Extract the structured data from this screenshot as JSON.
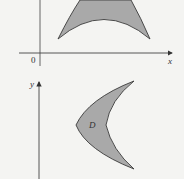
{
  "figure": {
    "top_panel": {
      "origin_label": "0",
      "x_axis_label": "x",
      "region": "crescent-arch"
    },
    "bottom_panel": {
      "y_axis_label": "y",
      "region_label": "D",
      "region": "crescent-opening-right"
    },
    "colors": {
      "region_fill": "#a9a9a9",
      "stroke": "#3a3a3a",
      "background": "#f4f4f2"
    }
  }
}
